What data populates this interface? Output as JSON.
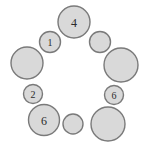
{
  "figure": {
    "name": "circle-ring-diagram",
    "width": 146,
    "height": 144,
    "background_color": "#ffffff",
    "node_fill_color": "#d9d9d9",
    "node_stroke_color": "#7a7a7a",
    "label_color": "#2b2b2b"
  },
  "chart_data": {
    "type": "scatter",
    "title": "",
    "xlabel": "",
    "ylabel": "",
    "xlim": [
      0,
      146
    ],
    "ylim": [
      0,
      144
    ],
    "grid": false,
    "legend": "none",
    "nodes": [
      {
        "id": "n1",
        "label": "4",
        "cx": 74,
        "cy": 22,
        "r": 16,
        "size": "large"
      },
      {
        "id": "n2",
        "label": "",
        "cx": 100,
        "cy": 42,
        "r": 10.5,
        "size": "small"
      },
      {
        "id": "n3",
        "label": "",
        "cx": 121,
        "cy": 65,
        "r": 17,
        "size": "large"
      },
      {
        "id": "n4",
        "label": "6",
        "cx": 114,
        "cy": 95,
        "r": 9.5,
        "size": "small"
      },
      {
        "id": "n5",
        "label": "",
        "cx": 108,
        "cy": 124,
        "r": 17,
        "size": "large"
      },
      {
        "id": "n6",
        "label": "",
        "cx": 73,
        "cy": 124,
        "r": 10,
        "size": "small"
      },
      {
        "id": "n7",
        "label": "6",
        "cx": 44,
        "cy": 120,
        "r": 15.5,
        "size": "large"
      },
      {
        "id": "n8",
        "label": "2",
        "cx": 33,
        "cy": 94,
        "r": 9.5,
        "size": "small"
      },
      {
        "id": "n9",
        "label": "",
        "cx": 27,
        "cy": 63,
        "r": 16,
        "size": "large"
      },
      {
        "id": "n10",
        "label": "1",
        "cx": 50,
        "cy": 42,
        "r": 10.5,
        "size": "small"
      }
    ]
  }
}
